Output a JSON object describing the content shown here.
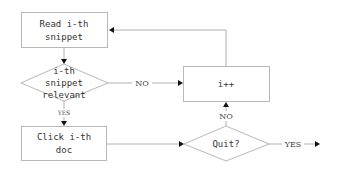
{
  "diagram": {
    "type": "flowchart",
    "colors": {
      "node_stroke": "#b8b8b8",
      "edge_stroke": "#b0b0b0",
      "arrowhead": "#111111",
      "text": "#333333"
    },
    "nodes": {
      "read_snippet": {
        "shape": "rectangle",
        "line1": "Read i-th",
        "line2": "snippet"
      },
      "relevant_check": {
        "shape": "diamond",
        "line1": "i-th",
        "line2": "snippet",
        "line3": "relevant"
      },
      "click_doc": {
        "shape": "rectangle",
        "line1": "Click i-th",
        "line2": "doc"
      },
      "increment": {
        "shape": "rectangle",
        "label": "i++"
      },
      "quit_check": {
        "shape": "diamond",
        "label": "Quit?"
      }
    },
    "edges": {
      "read_to_relevant": {
        "from": "read_snippet",
        "to": "relevant_check",
        "label": ""
      },
      "relevant_no": {
        "from": "relevant_check",
        "to": "increment",
        "label": "NO"
      },
      "relevant_yes": {
        "from": "relevant_check",
        "to": "click_doc",
        "label": "YES"
      },
      "click_to_quit": {
        "from": "click_doc",
        "to": "quit_check",
        "label": ""
      },
      "quit_no": {
        "from": "quit_check",
        "to": "increment",
        "label": "NO"
      },
      "quit_yes": {
        "from": "quit_check",
        "to": "exit",
        "label": "YES"
      },
      "increment_to_read": {
        "from": "increment",
        "to": "read_snippet",
        "label": ""
      }
    }
  }
}
